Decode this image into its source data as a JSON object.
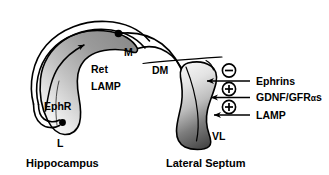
{
  "figure": {
    "background_color": "#ffffff",
    "ink_color": "#000000"
  },
  "hippocampus": {
    "name": "Hippocampus",
    "caption": "Hippocampus",
    "poles": {
      "medial_label": "M",
      "lateral_label": "L"
    },
    "gradient_labels": {
      "receptor": "Ret",
      "adhesion": "LAMP",
      "eph_receptor": "EphR"
    },
    "gradient": {
      "dark_end": "#8c8c8c",
      "light_end": "#f2f2f2"
    }
  },
  "lateral_septum": {
    "name": "Lateral Septum",
    "caption": "Lateral Septum",
    "poles": {
      "dorsomedial_label": "DM",
      "ventrolateral_label": "VL"
    },
    "gradient": {
      "light_end": "#f0f0f0",
      "dark_end": "#4a4a4a"
    }
  },
  "cues": [
    {
      "sign": "⊖",
      "sign_name": "minus-circle",
      "label": "Ephrins"
    },
    {
      "sign": "⊕",
      "sign_name": "plus-circle",
      "label": "GDNF/GFR"
    },
    {
      "sign": "⊕",
      "sign_name": "plus-circle",
      "label": "LAMP"
    }
  ],
  "cue_greek": {
    "gdnf_suffix_greek": "α",
    "gdnf_suffix_tail": "s"
  }
}
